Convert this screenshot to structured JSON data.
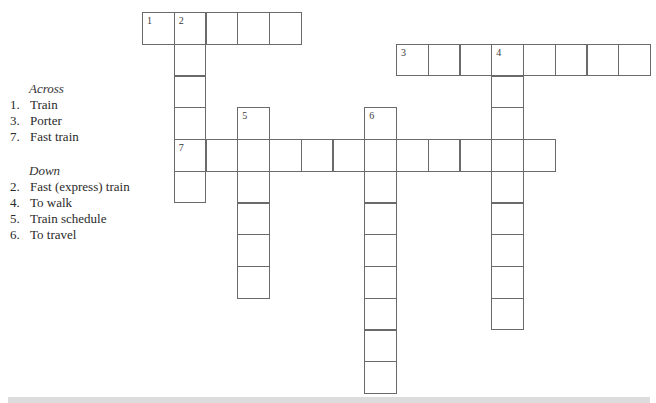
{
  "clues": {
    "across_heading": "Across",
    "across": [
      {
        "num": "1.",
        "text": "Train"
      },
      {
        "num": "3.",
        "text": "Porter"
      },
      {
        "num": "7.",
        "text": "Fast train"
      }
    ],
    "down_heading": "Down",
    "down": [
      {
        "num": "2.",
        "text": "Fast (express) train"
      },
      {
        "num": "4.",
        "text": "To walk"
      },
      {
        "num": "5.",
        "text": "Train schedule"
      },
      {
        "num": "6.",
        "text": "To travel"
      }
    ]
  },
  "grid": {
    "origin_x": 142,
    "origin_y": 12,
    "cell_size": 31.75,
    "border_color": "#6a6a6a",
    "entries": [
      {
        "number": "1",
        "direction": "across",
        "row": 0,
        "col": 0,
        "length": 5
      },
      {
        "number": "2",
        "direction": "down",
        "row": 0,
        "col": 1,
        "length": 6
      },
      {
        "number": "3",
        "direction": "across",
        "row": 1,
        "col": 8,
        "length": 8
      },
      {
        "number": "4",
        "direction": "down",
        "row": 1,
        "col": 11,
        "length": 9
      },
      {
        "number": "5",
        "direction": "down",
        "row": 3,
        "col": 3,
        "length": 6
      },
      {
        "number": "6",
        "direction": "down",
        "row": 3,
        "col": 7,
        "length": 9
      },
      {
        "number": "7",
        "direction": "across",
        "row": 4,
        "col": 1,
        "length": 12
      }
    ]
  }
}
